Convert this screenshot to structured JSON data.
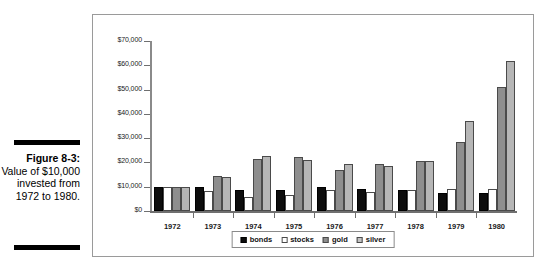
{
  "caption": {
    "label": "Figure 8-3:",
    "body": "Value of $10,000 invested from 1972 to 1980."
  },
  "chart_data": {
    "type": "bar",
    "title": "",
    "subtitle": "",
    "xlabel": "",
    "ylabel": "",
    "ylim": [
      0,
      70000
    ],
    "ytick_labels": [
      "$70,000",
      "$60,000",
      "$50,000",
      "$40,000",
      "$30,000",
      "$20,000",
      "$10,000",
      "$0"
    ],
    "ytick_values": [
      70000,
      60000,
      50000,
      40000,
      30000,
      20000,
      10000,
      0
    ],
    "grid": false,
    "legend_position": "bottom-center",
    "categories": [
      "1972",
      "1973",
      "1974",
      "1975",
      "1976",
      "1977",
      "1978",
      "1979",
      "1980"
    ],
    "series": [
      {
        "name": "bonds",
        "color": "#0d0d0d",
        "values": [
          10000,
          9700,
          8700,
          8600,
          9700,
          9100,
          8700,
          7300,
          7400
        ]
      },
      {
        "name": "stocks",
        "color": "#ffffff",
        "values": [
          10000,
          8200,
          5900,
          6600,
          8600,
          7700,
          8700,
          8900,
          9200
        ]
      },
      {
        "name": "gold",
        "color": "#8e8e8e",
        "values": [
          10000,
          14600,
          21400,
          22300,
          17000,
          19200,
          20400,
          28600,
          51000
        ]
      },
      {
        "name": "silver",
        "color": "#b6b6b6",
        "values": [
          10000,
          14000,
          22700,
          20900,
          19400,
          18500,
          20800,
          37000,
          61700
        ]
      }
    ],
    "legend": [
      {
        "label": "bonds",
        "color": "#0d0d0d"
      },
      {
        "label": "stocks",
        "color": "#ffffff"
      },
      {
        "label": "gold",
        "color": "#8e8e8e"
      },
      {
        "label": "silver",
        "color": "#c4c4c4"
      }
    ]
  }
}
